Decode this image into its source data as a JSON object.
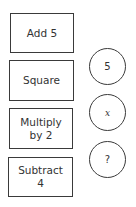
{
  "operation_boxes": [
    {
      "label": "Add 5"
    },
    {
      "label": "Square"
    },
    {
      "label": "Multiply by 2"
    },
    {
      "label": "Subtract 4"
    }
  ],
  "value_circles": [
    {
      "label": "5"
    },
    {
      "label": "x"
    },
    {
      "label": "?"
    }
  ],
  "colors": {
    "stroke": "#3a3a3a",
    "background": "#ffffff",
    "text": "#333333"
  }
}
